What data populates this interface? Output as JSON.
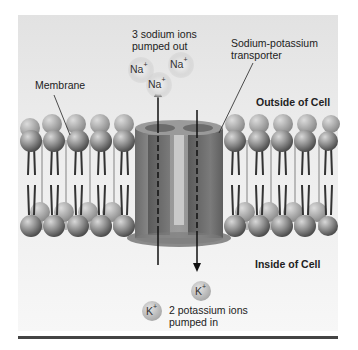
{
  "labels": {
    "sodium_out": [
      "3 sodium ions",
      "pumped out"
    ],
    "transporter": [
      "Sodium-potassium",
      "transporter"
    ],
    "membrane": "Membrane",
    "outside": "Outside of Cell",
    "inside": "Inside of Cell",
    "potassium_in": [
      "2 potassium ions",
      "pumped in"
    ]
  },
  "ions": {
    "sodium": [
      {
        "symbol": "Na",
        "charge": "+"
      },
      {
        "symbol": "Na",
        "charge": "+"
      },
      {
        "symbol": "Na",
        "charge": "+"
      }
    ],
    "potassium": [
      {
        "symbol": "K",
        "charge": "+"
      },
      {
        "symbol": "K",
        "charge": "+"
      }
    ]
  },
  "colors": {
    "background_top": "#e2e2e2",
    "background_bottom": "#f7f7f7",
    "phospholipid_head": "#8a8a8a",
    "transporter": "#7a7a7a",
    "rule": "#444444"
  }
}
